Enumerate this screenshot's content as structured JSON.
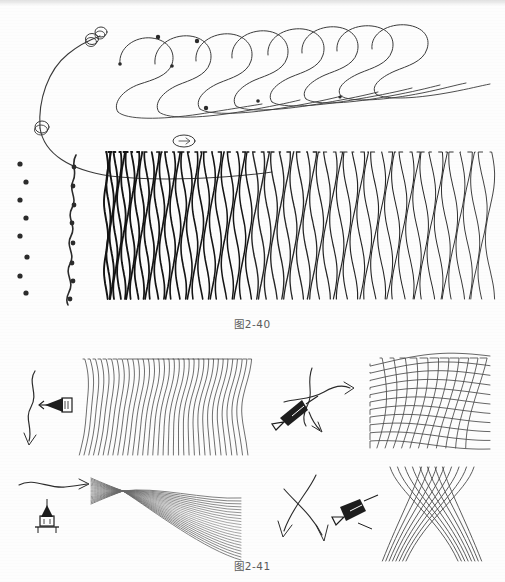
{
  "page": {
    "type": "scanned-book-page",
    "background_color": "#fdfdfd",
    "ink_color": "#2b2b2b",
    "width": 505,
    "height": 582
  },
  "figures": [
    {
      "id": "figure-2-40",
      "caption": "图2-40",
      "caption_x": 265,
      "caption_y": 322,
      "panels": [
        {
          "name": "nested-s-curves",
          "description": "fan of nested long S-shaped pen strokes with looped knots and endpoint dots",
          "curve_count": 9,
          "loop_count": 4,
          "dot_count": 5
        },
        {
          "name": "dot-column",
          "description": "staggered vertical column of round ink dots",
          "dot_count": 8
        },
        {
          "name": "beaded-zigzag-line",
          "description": "single vertical wavy zigzag stroke with dots at inflection points",
          "bead_count": 8
        },
        {
          "name": "wavy-line-texture-block",
          "description": "dense block of vertical wavy pen lines, tight at left, loose at right",
          "line_count": 64
        }
      ]
    },
    {
      "id": "figure-2-41",
      "caption": "图2-41",
      "caption_x": 265,
      "caption_y": 566,
      "panels": [
        {
          "name": "panel-vertical-waves",
          "direction_icon": "pen-nib-left-icon",
          "arrow": "curved-down-arrow",
          "pattern": "parallel vertical wavy strokes",
          "line_count": 34
        },
        {
          "name": "panel-crosshatch-grid",
          "direction_icon": "pen-nib-diagonal-icon",
          "arrow": "two-branch-arrow",
          "pattern": "woven curved crosshatch grid",
          "line_count": 22
        },
        {
          "name": "panel-bowtie-fan",
          "direction_icon": "pen-nib-up-icon",
          "arrow": "horizontal-right-arrow",
          "pattern": "pinched hourglass fan of sweeping strokes",
          "line_count": 22
        },
        {
          "name": "panel-x-crossing",
          "direction_icon": "pen-nib-diagonal-icon",
          "arrow": "two-crossing-down-arrows",
          "pattern": "two bundles of curves crossing in an X",
          "line_count": 16
        }
      ]
    }
  ]
}
